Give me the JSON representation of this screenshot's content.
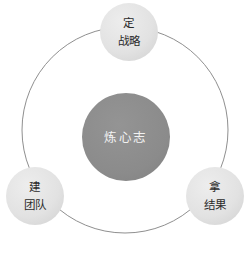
{
  "diagram": {
    "type": "circular-hub-and-nodes",
    "background_color": "#ffffff",
    "ring": {
      "name": "outer-ring",
      "stroke_color": "#8f8f8f",
      "stroke_width": 1,
      "cx": 125,
      "cy": 130,
      "r": 103
    },
    "center": {
      "label_line1": "炼心志",
      "fill_color": "#8c8c8c",
      "text_color": "#f2f2f2",
      "cx": 126,
      "cy": 137,
      "r": 44
    },
    "nodes": [
      {
        "id": "node-ding-zhanlue",
        "line1": "定",
        "line2": "战略",
        "cx": 129,
        "cy": 32,
        "r": 29,
        "fill_color": "#e3e3e3",
        "text_color": "#2b2b2b"
      },
      {
        "id": "node-jian-tuandui",
        "line1": "建",
        "line2": "团队",
        "cx": 35,
        "cy": 196,
        "r": 29,
        "fill_color": "#e3e3e3",
        "text_color": "#2b2b2b"
      },
      {
        "id": "node-na-jieguo",
        "line1": "拿",
        "line2": "结果",
        "cx": 215,
        "cy": 196,
        "r": 29,
        "fill_color": "#e3e3e3",
        "text_color": "#2b2b2b"
      }
    ]
  }
}
